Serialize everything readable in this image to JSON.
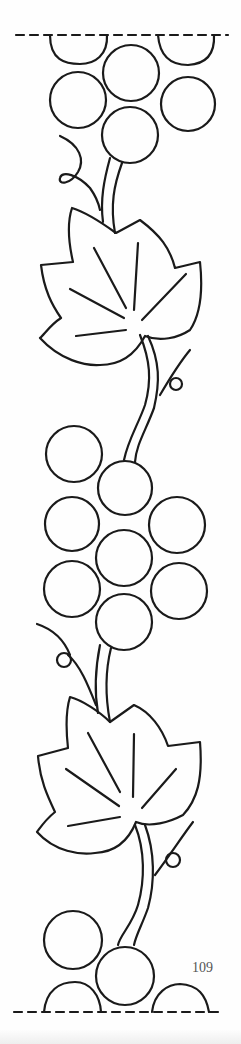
{
  "page": {
    "type": "embroidery-pattern",
    "page_number": "109"
  },
  "colors": {
    "line": "#1a1a1a",
    "background": "#fefefe"
  }
}
